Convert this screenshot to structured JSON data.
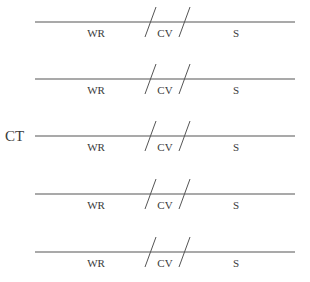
{
  "diagram": {
    "side_label": "CT",
    "rows": [
      {
        "segments": [
          "WR",
          "CV",
          "S"
        ]
      },
      {
        "segments": [
          "WR",
          "CV",
          "S"
        ]
      },
      {
        "segments": [
          "WR",
          "CV",
          "S"
        ]
      },
      {
        "segments": [
          "WR",
          "CV",
          "S"
        ]
      },
      {
        "segments": [
          "WR",
          "CV",
          "S"
        ]
      }
    ],
    "line_color": "#555555",
    "text_color": "#3a3a3a"
  }
}
